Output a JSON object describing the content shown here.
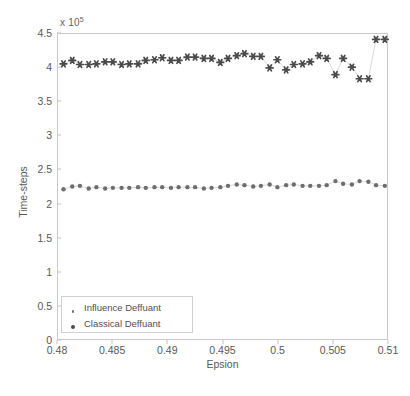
{
  "chart_data": {
    "type": "scatter",
    "title": "",
    "xlabel": "Epsion",
    "ylabel": "Time-steps",
    "y_exponent_label": "x 10",
    "y_exponent_value": "5",
    "y_scale_factor": 100000,
    "xlim": [
      0.48,
      0.51
    ],
    "ylim": [
      0,
      4.5
    ],
    "xticks": [
      0.48,
      0.485,
      0.49,
      0.495,
      0.5,
      0.505,
      0.51
    ],
    "xtick_labels": [
      "0.48",
      "0.485",
      "0.49",
      "0.495",
      "0.5",
      "0.505",
      "0.51"
    ],
    "yticks": [
      0,
      0.5,
      1,
      1.5,
      2,
      2.5,
      3,
      3.5,
      4,
      4.5
    ],
    "ytick_labels": [
      "0",
      "0.5",
      "1",
      "1.5",
      "2",
      "2.5",
      "3",
      "3.5",
      "4",
      "4.5"
    ],
    "grid": false,
    "legend_position": "lower left",
    "marker_color": "#4a4a4a",
    "line_color": "#c8c8c8",
    "axis_color": "#c4c4c4",
    "series": [
      {
        "name": "Influence Deffuant",
        "marker": "dot",
        "marker_size": 2.2,
        "x": [
          0.4805,
          0.4813,
          0.482,
          0.4828,
          0.4835,
          0.4843,
          0.485,
          0.4858,
          0.4865,
          0.4873,
          0.488,
          0.4888,
          0.4895,
          0.4903,
          0.491,
          0.4918,
          0.4925,
          0.4933,
          0.494,
          0.4948,
          0.4955,
          0.4963,
          0.497,
          0.4978,
          0.4985,
          0.4993,
          0.5,
          0.5008,
          0.5015,
          0.5023,
          0.503,
          0.5038,
          0.5045,
          0.5053,
          0.506,
          0.5068,
          0.5075,
          0.5083,
          0.509,
          0.5098
        ],
        "values": [
          2.21,
          2.25,
          2.26,
          2.22,
          2.24,
          2.22,
          2.23,
          2.23,
          2.23,
          2.24,
          2.23,
          2.24,
          2.24,
          2.23,
          2.24,
          2.24,
          2.24,
          2.22,
          2.23,
          2.24,
          2.26,
          2.28,
          2.27,
          2.25,
          2.26,
          2.28,
          2.24,
          2.27,
          2.28,
          2.26,
          2.26,
          2.26,
          2.27,
          2.33,
          2.29,
          2.28,
          2.33,
          2.32,
          2.27,
          2.26
        ]
      },
      {
        "name": "Classical Deffuant",
        "marker": "star",
        "marker_size": 3.4,
        "x": [
          0.4805,
          0.4813,
          0.482,
          0.4828,
          0.4835,
          0.4843,
          0.485,
          0.4858,
          0.4865,
          0.4873,
          0.488,
          0.4888,
          0.4895,
          0.4903,
          0.491,
          0.4918,
          0.4925,
          0.4933,
          0.494,
          0.4948,
          0.4955,
          0.4963,
          0.497,
          0.4978,
          0.4985,
          0.4993,
          0.5,
          0.5008,
          0.5015,
          0.5023,
          0.503,
          0.5038,
          0.5045,
          0.5053,
          0.506,
          0.5068,
          0.5075,
          0.5083,
          0.509,
          0.5098
        ],
        "values": [
          4.06,
          4.11,
          4.05,
          4.05,
          4.06,
          4.09,
          4.09,
          4.05,
          4.06,
          4.06,
          4.11,
          4.12,
          4.15,
          4.11,
          4.11,
          4.16,
          4.16,
          4.14,
          4.14,
          4.08,
          4.14,
          4.18,
          4.21,
          4.17,
          4.17,
          4.0,
          4.12,
          3.97,
          4.05,
          4.06,
          4.09,
          4.18,
          4.14,
          3.9,
          4.14,
          4.01,
          3.84,
          3.84,
          4.42,
          4.42
        ]
      }
    ]
  },
  "legend": {
    "entries": [
      {
        "label": "Influence Deffuant",
        "marker": "dot"
      },
      {
        "label": "Classical Deffuant",
        "marker": "star"
      }
    ]
  }
}
